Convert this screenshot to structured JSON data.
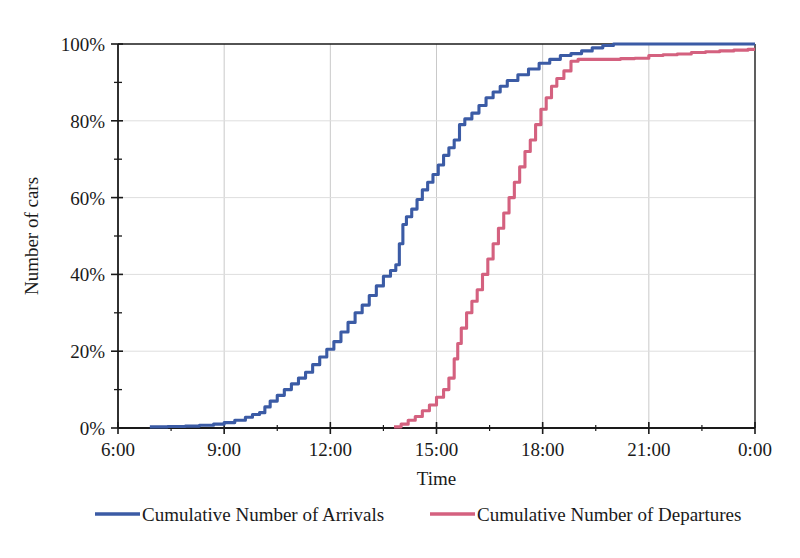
{
  "chart_data": {
    "type": "line",
    "title": "",
    "subtitle": "",
    "xlabel": "Time",
    "ylabel": "Number of cars",
    "xlim": [
      6,
      24
    ],
    "ylim": [
      0,
      100
    ],
    "grid": true,
    "legend_position": "bottom",
    "x_tick_labels": [
      "6:00",
      "9:00",
      "12:00",
      "15:00",
      "18:00",
      "21:00",
      "0:00"
    ],
    "x_tick_values": [
      6,
      9,
      12,
      15,
      18,
      21,
      24
    ],
    "x_minor_tick_values": [
      7.5,
      10.5,
      13.5,
      16.5,
      19.5,
      22.5
    ],
    "y_tick_labels": [
      "0%",
      "20%",
      "40%",
      "60%",
      "80%",
      "100%"
    ],
    "y_tick_values": [
      0,
      20,
      40,
      60,
      80,
      100
    ],
    "y_minor_tick_values": [
      10,
      30,
      50,
      70,
      90
    ],
    "colors": {
      "arrivals": "#3B5BA5",
      "departures": "#D4617F",
      "axis": "#1a1a1a",
      "grid": "#c9c9c9",
      "background": "#ffffff"
    },
    "series": [
      {
        "name": "Cumulative Number of Arrivals",
        "color": "#3B5BA5",
        "step": true,
        "x": [
          6.9,
          7.4,
          7.9,
          8.3,
          8.7,
          9.0,
          9.3,
          9.6,
          9.8,
          10.0,
          10.15,
          10.3,
          10.5,
          10.7,
          10.9,
          11.1,
          11.3,
          11.5,
          11.7,
          11.9,
          12.1,
          12.3,
          12.5,
          12.7,
          12.9,
          13.1,
          13.3,
          13.5,
          13.7,
          13.85,
          13.95,
          14.05,
          14.15,
          14.3,
          14.45,
          14.6,
          14.75,
          14.9,
          15.05,
          15.2,
          15.35,
          15.5,
          15.65,
          15.8,
          16.0,
          16.2,
          16.4,
          16.6,
          16.8,
          17.0,
          17.3,
          17.6,
          17.9,
          18.2,
          18.5,
          18.8,
          19.1,
          19.4,
          19.7,
          20.0,
          21.0,
          22.0,
          23.0,
          24.0
        ],
        "y": [
          0.3,
          0.4,
          0.5,
          0.7,
          1.0,
          1.4,
          2.0,
          2.8,
          3.5,
          4.0,
          5.5,
          7.0,
          8.5,
          10.0,
          11.5,
          13.0,
          14.5,
          16.5,
          18.5,
          20.5,
          22.5,
          25.0,
          27.5,
          30.0,
          32.0,
          34.5,
          37.0,
          39.5,
          41.0,
          42.5,
          48.0,
          53.0,
          55.0,
          57.0,
          59.5,
          62.0,
          64.0,
          66.0,
          68.5,
          71.0,
          73.0,
          75.0,
          79.0,
          80.5,
          82.0,
          84.0,
          86.0,
          87.5,
          89.0,
          90.5,
          92.0,
          93.5,
          95.0,
          96.0,
          97.0,
          97.5,
          98.2,
          99.0,
          99.6,
          100.0,
          100.0,
          100.0,
          100.0,
          100.0
        ]
      },
      {
        "name": "Cumulative Number of Departures",
        "color": "#D4617F",
        "step": true,
        "x": [
          13.8,
          14.0,
          14.2,
          14.4,
          14.6,
          14.8,
          15.0,
          15.2,
          15.35,
          15.5,
          15.6,
          15.7,
          15.85,
          16.0,
          16.15,
          16.3,
          16.45,
          16.6,
          16.75,
          16.9,
          17.05,
          17.2,
          17.35,
          17.5,
          17.65,
          17.8,
          17.95,
          18.1,
          18.25,
          18.4,
          18.6,
          18.8,
          19.0,
          19.4,
          19.8,
          20.2,
          20.6,
          21.0,
          21.4,
          21.8,
          22.2,
          22.6,
          23.0,
          23.4,
          23.8,
          24.0
        ],
        "y": [
          0.3,
          1.0,
          2.0,
          3.0,
          4.5,
          6.0,
          8.0,
          10.0,
          13.0,
          18.0,
          22.0,
          26.0,
          30.0,
          33.0,
          36.0,
          40.0,
          44.0,
          48.0,
          52.0,
          56.0,
          60.0,
          64.0,
          68.0,
          72.0,
          75.0,
          79.0,
          83.0,
          86.0,
          89.0,
          91.0,
          93.0,
          95.5,
          96.0,
          96.0,
          96.0,
          96.2,
          96.3,
          97.0,
          97.2,
          97.4,
          97.8,
          98.0,
          98.2,
          98.4,
          98.6,
          98.6
        ]
      }
    ],
    "legend": [
      {
        "label": "Cumulative Number of Arrivals",
        "color": "#3B5BA5"
      },
      {
        "label": "Cumulative Number of Departures",
        "color": "#D4617F"
      }
    ]
  }
}
